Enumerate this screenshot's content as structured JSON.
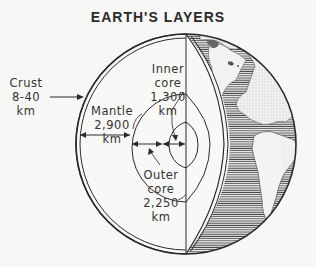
{
  "title": "EARTH'S LAYERS",
  "labels": {
    "crust": {
      "name": "Crust",
      "thickness": "8-40",
      "unit": "km"
    },
    "mantle": {
      "name": "Mantle",
      "thickness": "2,900 km"
    },
    "inner_core": {
      "name_line1": "Inner",
      "name_line2": "core",
      "thickness": "1,300",
      "unit": "km"
    },
    "outer_core": {
      "name_line1": "Outer",
      "name_line2": "core",
      "thickness": "2,250",
      "unit": "km"
    }
  },
  "colors": {
    "background": "#f7f7f5",
    "ink": "#2a2a2a",
    "ocean_hatch": "#555555",
    "land": "#f2f2f0"
  }
}
